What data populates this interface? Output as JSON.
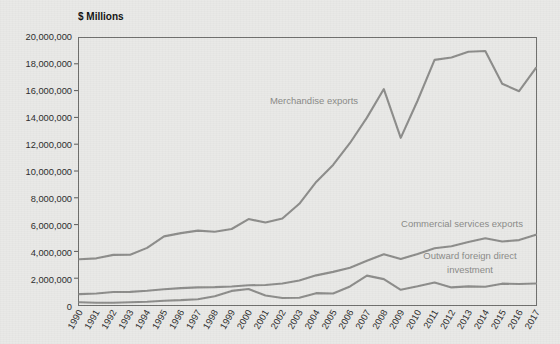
{
  "chart_data": {
    "type": "line",
    "title": "$ Millions",
    "xlabel": "",
    "ylabel": "$ Millions",
    "grid": false,
    "legend_position": "inline-annotations",
    "ylim": [
      0,
      20000000
    ],
    "ytick_labels": [
      "20,000,000",
      "18,000,000",
      "16,000,000",
      "14,000,000",
      "12,000,000",
      "10,000,000",
      "8,000,000",
      "6,000,000",
      "4,000,000",
      "2,000,000",
      "0"
    ],
    "ytick_values": [
      20000000,
      18000000,
      16000000,
      14000000,
      12000000,
      10000000,
      8000000,
      6000000,
      4000000,
      2000000,
      0
    ],
    "categories": [
      "1990",
      "1991",
      "1992",
      "1993",
      "1994",
      "1995",
      "1996",
      "1997",
      "1998",
      "1999",
      "2000",
      "2001",
      "2002",
      "2003",
      "2004",
      "2005",
      "2006",
      "2007",
      "2008",
      "2009",
      "2010",
      "2011",
      "2012",
      "2013",
      "2014",
      "2015",
      "2016",
      "2017"
    ],
    "series": [
      {
        "name": "Merchandise exports",
        "color": "#8d8d8b",
        "values": [
          3450000,
          3520000,
          3780000,
          3790000,
          4300000,
          5160000,
          5400000,
          5590000,
          5500000,
          5710000,
          6450000,
          6190000,
          6490000,
          7590000,
          9220000,
          10490000,
          12130000,
          14020000,
          16150000,
          12510000,
          15300000,
          18330000,
          18510000,
          18940000,
          18990000,
          16550000,
          15990000,
          17730000
        ]
      },
      {
        "name": "Commercial services exports",
        "color": "#8d8d8b",
        "values": [
          850000,
          900000,
          1010000,
          1020000,
          1100000,
          1210000,
          1300000,
          1350000,
          1370000,
          1420000,
          1510000,
          1530000,
          1640000,
          1870000,
          2250000,
          2510000,
          2820000,
          3340000,
          3830000,
          3470000,
          3850000,
          4270000,
          4420000,
          4740000,
          5020000,
          4780000,
          4880000,
          5280000
        ]
      },
      {
        "name": "Outward foreign direct investment",
        "color": "#8d8d8b",
        "values": [
          240000,
          200000,
          210000,
          240000,
          280000,
          360000,
          400000,
          470000,
          690000,
          1090000,
          1230000,
          750000,
          560000,
          580000,
          920000,
          890000,
          1420000,
          2230000,
          1970000,
          1170000,
          1430000,
          1720000,
          1350000,
          1430000,
          1400000,
          1630000,
          1600000,
          1640000
        ]
      }
    ],
    "annotations": [
      {
        "text": "Merchandise exports",
        "series": "Merchandise exports"
      },
      {
        "text": "Commercial services exports",
        "series": "Commercial services exports"
      },
      {
        "text": "Outward foreign direct",
        "series": "Outward foreign direct investment"
      },
      {
        "text": "investment",
        "series": "Outward foreign direct investment"
      }
    ],
    "colors": {
      "background": "#e9e9e7",
      "line": "#8d8d8b",
      "axis": "#6f6f6d",
      "tick_text": "#2b2b2b",
      "annotation_text": "#8a8a88"
    }
  },
  "labels": {
    "unit_title": "$ Millions",
    "ann_merchandise": "Merchandise exports",
    "ann_commercial": "Commercial services exports",
    "ann_fdi_line1": "Outward foreign direct",
    "ann_fdi_line2": "investment",
    "y_0": "20,000,000",
    "y_1": "18,000,000",
    "y_2": "16,000,000",
    "y_3": "14,000,000",
    "y_4": "12,000,000",
    "y_5": "10,000,000",
    "y_6": "8,000,000",
    "y_7": "6,000,000",
    "y_8": "4,000,000",
    "y_9": "2,000,000",
    "y_10": "0",
    "x_1990": "1990",
    "x_1991": "1991",
    "x_1992": "1992",
    "x_1993": "1993",
    "x_1994": "1994",
    "x_1995": "1995",
    "x_1996": "1996",
    "x_1997": "1997",
    "x_1998": "1998",
    "x_1999": "1999",
    "x_2000": "2000",
    "x_2001": "2001",
    "x_2002": "2002",
    "x_2003": "2003",
    "x_2004": "2004",
    "x_2005": "2005",
    "x_2006": "2006",
    "x_2007": "2007",
    "x_2008": "2008",
    "x_2009": "2009",
    "x_2010": "2010",
    "x_2011": "2011",
    "x_2012": "2012",
    "x_2013": "2013",
    "x_2014": "2014",
    "x_2015": "2015",
    "x_2016": "2016",
    "x_2017": "2017"
  }
}
